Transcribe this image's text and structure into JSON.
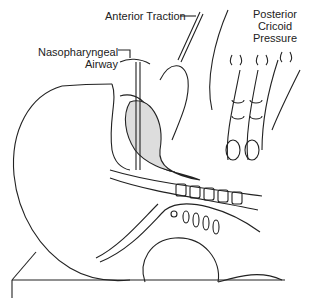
{
  "figure": {
    "labels": {
      "anterior_traction": "Anterior Traction",
      "nasopharyngeal_line1": "Nasopharyngeal",
      "nasopharyngeal_line2": "Airway",
      "posterior_line1": "Posterior",
      "posterior_line2": "Cricoid",
      "posterior_line3": "Pressure"
    },
    "colors": {
      "line": "#222222",
      "background": "#ffffff",
      "hatch": "#555555"
    }
  }
}
